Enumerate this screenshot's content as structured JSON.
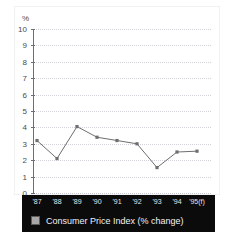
{
  "chart_data": {
    "type": "line",
    "title": "",
    "xlabel": "",
    "ylabel": "%",
    "ylim": [
      0,
      10
    ],
    "ytick_step": 1,
    "yticks": [
      10,
      9,
      8,
      7,
      6,
      5,
      4,
      3,
      2,
      1,
      0
    ],
    "grid": true,
    "grid_style": "dotted-horizontal",
    "legend_position": "bottom",
    "categories": [
      "'87",
      "'88",
      "'89",
      "'90",
      "'91",
      "'92",
      "'93",
      "'94",
      "'95(f)"
    ],
    "series": [
      {
        "name": "Consumer Price Index (% change)",
        "color": "#6e6e6e",
        "marker": "square",
        "values": [
          3.2,
          2.1,
          4.05,
          3.4,
          3.2,
          3.0,
          1.55,
          2.5,
          2.55
        ]
      }
    ]
  },
  "axis": {
    "unit_label": "%",
    "y_tick_labels": [
      "10",
      "9",
      "8",
      "7",
      "6",
      "5",
      "4",
      "3",
      "2",
      "1",
      "0"
    ],
    "x_tick_labels": [
      "'87",
      "'88",
      "'89",
      "'90",
      "'91",
      "'92",
      "'93",
      "'94",
      "'95(f)"
    ]
  },
  "legend": {
    "items": [
      {
        "label": "Consumer Price Index (% change)",
        "swatch_color": "#a8a8a8"
      }
    ]
  },
  "colors": {
    "background": "#ffffff",
    "panel": "#0b0b0b",
    "panel_text": "#f2f2f2",
    "axis": "#6e6e6e",
    "grid": "#d2d2d8",
    "line": "#6e6e6e",
    "tick_text": "#4a4a4a"
  }
}
